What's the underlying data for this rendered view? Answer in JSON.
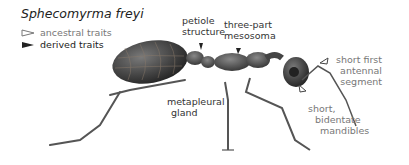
{
  "title": "Sphecomyrma freyi",
  "legend": [
    {
      "label": "ancestral traits",
      "marker": "open-triangle-pointer"
    },
    {
      "label": "derived traits",
      "marker": "filled-triangle-pointer"
    }
  ],
  "labels": {
    "petiole": [
      "petiole",
      "structure"
    ],
    "mesosoma": [
      "three-part",
      "mesosoma"
    ],
    "metapleural": [
      "metapleural",
      "gland"
    ],
    "antennal": [
      "short first",
      "antennal",
      "segment"
    ],
    "mandibles": [
      "short,",
      "bidentate",
      "mandibles"
    ]
  },
  "colors": {
    "ancestral": "#777777",
    "derived": "#222222",
    "body": "#3d3d3d"
  }
}
